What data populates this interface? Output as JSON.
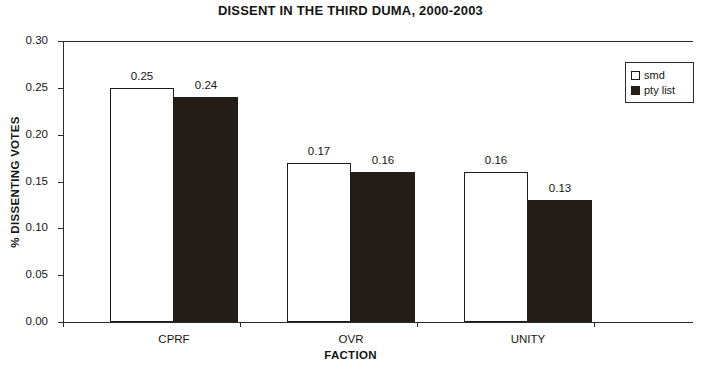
{
  "chart_data": {
    "type": "bar",
    "title": "DISSENT IN THE THIRD DUMA, 2000-2003",
    "xlabel": "FACTION",
    "ylabel": "% DISSENTING VOTES",
    "categories": [
      "CPRF",
      "OVR",
      "UNITY"
    ],
    "series": [
      {
        "name": "smd",
        "color": "#ffffff",
        "values": [
          0.25,
          0.17,
          0.16
        ],
        "labels": [
          "0.25",
          "0.17",
          "0.16"
        ]
      },
      {
        "name": "pty list",
        "color": "#241c16",
        "values": [
          0.24,
          0.16,
          0.13
        ],
        "labels": [
          "0.24",
          "0.16",
          "0.13"
        ]
      }
    ],
    "ylim": [
      0.0,
      0.3
    ],
    "yticks": [
      0.3,
      0.25,
      0.2,
      0.15,
      0.1,
      0.05,
      0.0
    ],
    "ytick_labels": [
      "0.30",
      "0.25",
      "0.20",
      "0.15",
      "0.10",
      "0.05",
      "0.00"
    ],
    "grid": false,
    "legend_position": "top-right",
    "legend_entries": [
      "smd",
      "pty list"
    ]
  }
}
